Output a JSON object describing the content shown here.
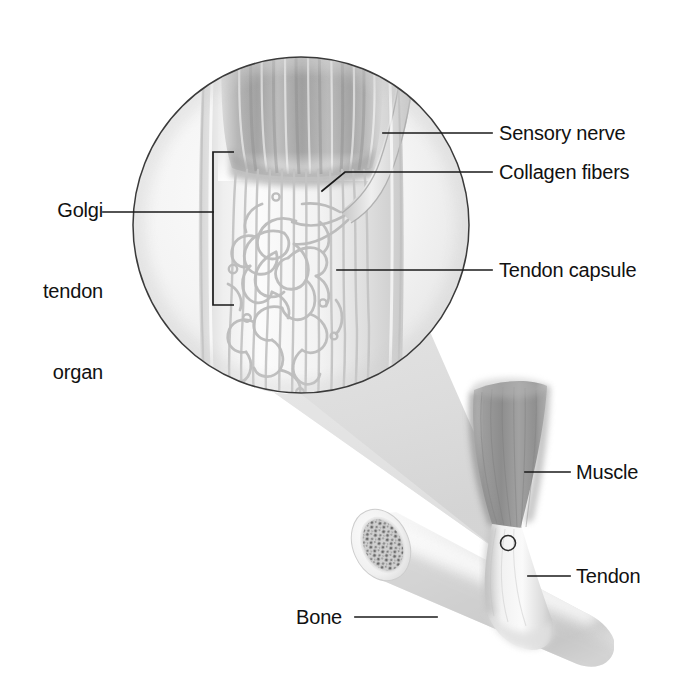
{
  "figure": {
    "width": 682,
    "height": 690,
    "background_color": "#ffffff",
    "line_color": "#1a1a1a",
    "style": "grayscale medical illustration"
  },
  "labels": {
    "golgi_tendon_organ": "Golgi\ntendon\norgan",
    "golgi_line_1": "Golgi",
    "golgi_line_2": "tendon",
    "golgi_line_3": "organ",
    "sensory_nerve": "Sensory nerve",
    "collagen_fibers": "Collagen fibers",
    "tendon_capsule": "Tendon capsule",
    "muscle": "Muscle",
    "tendon": "Tendon",
    "bone": "Bone"
  },
  "colors": {
    "outline": "#1a1a1a",
    "circle_border": "#3a3a3a",
    "muscle_dark": "#9a9a9a",
    "muscle_mid": "#b4b4b4",
    "tendon_light": "#e8e8e8",
    "cone_fill": "#dcdcdc",
    "bone_fill": "#e2e2e2",
    "bone_marrow": "#8a8a8a",
    "fiber_gray": "#c9c9c9",
    "text": "#111111"
  },
  "structures": [
    {
      "name": "magnified-circle-inset",
      "shape": "circle",
      "cx": 301,
      "cy": 225,
      "r": 169
    },
    {
      "name": "muscle-fibers-bundle",
      "region": "top of inset"
    },
    {
      "name": "collagen-fiber-network",
      "region": "center of inset"
    },
    {
      "name": "sensory-nerve-axon",
      "region": "right of inset"
    },
    {
      "name": "tendon-capsule-sheath",
      "region": "inset sheath"
    },
    {
      "name": "magnification-cone",
      "shape": "wedge"
    },
    {
      "name": "muscle-belly",
      "region": "lower right"
    },
    {
      "name": "tendon-shaft",
      "region": "lower right"
    },
    {
      "name": "bone-cylinder",
      "region": "lower center"
    },
    {
      "name": "bone-cross-section",
      "region": "lower left of bone"
    },
    {
      "name": "junction-marker",
      "shape": "circle",
      "cx": 508,
      "cy": 543,
      "r": 7
    }
  ],
  "leader_lines": [
    {
      "name": "golgi-tendon-organ-leader",
      "from": [
        103,
        212
      ],
      "to": [
        213,
        212
      ],
      "has_bracket": true
    },
    {
      "name": "sensory-nerve-leader",
      "from": [
        383,
        133
      ],
      "to": [
        492,
        133
      ]
    },
    {
      "name": "collagen-fibers-leader",
      "from": [
        322,
        190
      ],
      "to": [
        492,
        172
      ],
      "elbow": [
        345,
        172
      ]
    },
    {
      "name": "tendon-capsule-leader",
      "from": [
        337,
        270
      ],
      "to": [
        492,
        270
      ]
    },
    {
      "name": "muscle-leader",
      "from": [
        525,
        472
      ],
      "to": [
        568,
        472
      ]
    },
    {
      "name": "tendon-leader",
      "from": [
        530,
        576
      ],
      "to": [
        568,
        576
      ]
    },
    {
      "name": "bone-leader",
      "from": [
        355,
        617
      ],
      "to": [
        435,
        617
      ]
    }
  ],
  "bracket": {
    "name": "golgi-tendon-organ-bracket",
    "x": 213,
    "top": 152,
    "bottom": 305,
    "arm_length": 21
  }
}
